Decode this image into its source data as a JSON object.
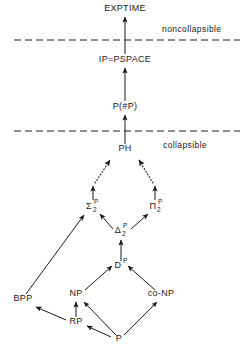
{
  "figure": {
    "background_color": "#ffffff",
    "line_color": "#1a1a1a"
  },
  "regions": [
    {
      "id": "noncollapsible",
      "label": "noncollapsible",
      "x": 162,
      "y": 32
    },
    {
      "id": "collapsible",
      "label": "collapsible",
      "x": 163,
      "y": 148
    }
  ],
  "dividers": [
    {
      "id": "upper-divider",
      "y": 40
    },
    {
      "id": "lower-divider",
      "y": 131
    }
  ],
  "nodes": [
    {
      "id": "exptime",
      "label": "EXPTIME",
      "sub": "",
      "sup": "",
      "x": 125,
      "y": 11
    },
    {
      "id": "ip-pspace",
      "label": "IP=PSPACE",
      "sub": "",
      "sup": "",
      "x": 125,
      "y": 62
    },
    {
      "id": "p-sharp-p",
      "label": "P(#P)",
      "sub": "",
      "sup": "",
      "x": 125,
      "y": 109
    },
    {
      "id": "ph",
      "label": "PH",
      "sub": "",
      "sup": "",
      "x": 125,
      "y": 151
    },
    {
      "id": "sigma2p",
      "label": "Σ",
      "sub": "2",
      "sup": "P",
      "x": 92,
      "y": 209
    },
    {
      "id": "pi2p",
      "label": "Π",
      "sub": "2",
      "sup": "P",
      "x": 156,
      "y": 209
    },
    {
      "id": "delta2p",
      "label": "Δ",
      "sub": "2",
      "sup": "P",
      "x": 121,
      "y": 233
    },
    {
      "id": "dp",
      "label": "D",
      "sub": "",
      "sup": "P",
      "x": 119,
      "y": 268
    },
    {
      "id": "np",
      "label": "NP",
      "sub": "",
      "sup": "",
      "x": 76,
      "y": 296
    },
    {
      "id": "conp",
      "label": "co-NP",
      "sub": "",
      "sup": "",
      "x": 161,
      "y": 296
    },
    {
      "id": "bpp",
      "label": "BPP",
      "sub": "",
      "sup": "",
      "x": 23,
      "y": 301
    },
    {
      "id": "rp",
      "label": "RP",
      "sub": "",
      "sup": "",
      "x": 76,
      "y": 324
    },
    {
      "id": "p",
      "label": "P",
      "sub": "",
      "sup": "",
      "x": 119,
      "y": 341
    }
  ],
  "edges": [
    {
      "id": "ip-pspace-to-exptime",
      "from": "ip-pspace",
      "to": "exptime",
      "style": "solid"
    },
    {
      "id": "p-sharp-p-to-ip",
      "from": "p-sharp-p",
      "to": "ip-pspace",
      "style": "solid"
    },
    {
      "id": "ph-to-p-sharp-p",
      "from": "ph",
      "to": "p-sharp-p",
      "style": "solid"
    },
    {
      "id": "sigma2p-dots-to-ph",
      "from": "sigma2p",
      "to": "ph",
      "style": "dotted"
    },
    {
      "id": "pi2p-dots-to-ph",
      "from": "pi2p",
      "to": "ph",
      "style": "dotted"
    },
    {
      "id": "delta2p-to-sigma2p",
      "from": "delta2p",
      "to": "sigma2p",
      "style": "solid"
    },
    {
      "id": "delta2p-to-pi2p",
      "from": "delta2p",
      "to": "pi2p",
      "style": "solid"
    },
    {
      "id": "dp-to-delta2p",
      "from": "dp",
      "to": "delta2p",
      "style": "solid"
    },
    {
      "id": "np-to-dp",
      "from": "np",
      "to": "dp",
      "style": "solid"
    },
    {
      "id": "conp-to-dp",
      "from": "conp",
      "to": "dp",
      "style": "solid"
    },
    {
      "id": "bpp-to-sigma2p",
      "from": "bpp",
      "to": "sigma2p",
      "style": "solid"
    },
    {
      "id": "rp-to-np",
      "from": "rp",
      "to": "np",
      "style": "solid"
    },
    {
      "id": "rp-to-bpp",
      "from": "rp",
      "to": "bpp",
      "style": "solid"
    },
    {
      "id": "p-to-rp",
      "from": "p",
      "to": "rp",
      "style": "solid"
    },
    {
      "id": "p-to-np",
      "from": "p",
      "to": "np",
      "style": "solid"
    },
    {
      "id": "p-to-conp",
      "from": "p",
      "to": "conp",
      "style": "solid"
    }
  ]
}
